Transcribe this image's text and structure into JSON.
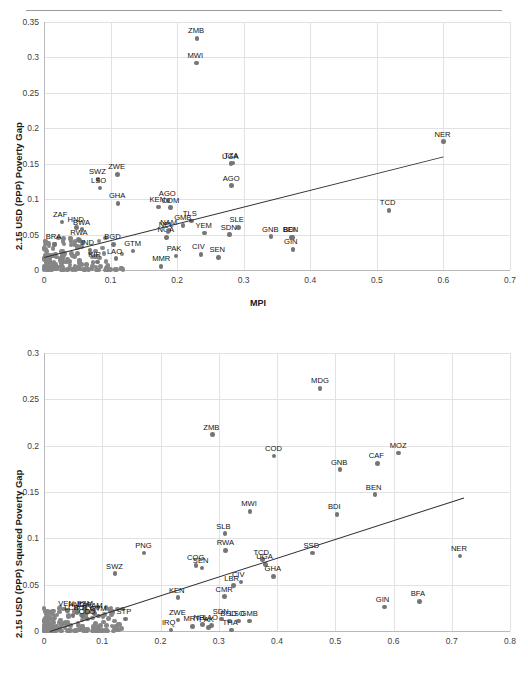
{
  "document": {
    "clipped_header_text": "2.15 USD (PPP) poverty measures and MPI"
  },
  "charts": [
    {
      "id": "chart1",
      "ylabel": "2.15 USD (PPP)  Poverty Gap",
      "xlabel": "MPI",
      "yticks": [
        "0",
        "0.05",
        "0.1",
        "0.15",
        "0.2",
        "0.25",
        "0.3",
        "0.35"
      ],
      "xticks": [
        "0",
        "0.1",
        "0.2",
        "0.3",
        "0.4",
        "0.5",
        "0.6",
        "0.7"
      ]
    },
    {
      "id": "chart2",
      "ylabel": "2.15 USD (PPP) Squared  Poverty Gap",
      "xlabel": "",
      "yticks": [
        "0",
        "0.05",
        "0.1",
        "0.15",
        "0.2",
        "0.25",
        "0.3"
      ],
      "xticks": [
        "0",
        "0.1",
        "0.2",
        "0.3",
        "0.4",
        "0.5",
        "0.6",
        "0.7",
        "0.8"
      ]
    }
  ],
  "chart_data": [
    {
      "type": "scatter",
      "title": "",
      "xlabel": "MPI",
      "ylabel": "2.15 USD (PPP)  Poverty Gap",
      "xlim": [
        0,
        0.7
      ],
      "ylim": [
        0,
        0.35
      ],
      "grid": true,
      "legend": "none",
      "trendline": {
        "x0": 0.0,
        "y0": 0.018,
        "x1": 0.6,
        "y1": 0.16
      },
      "labeled_points": [
        {
          "label": "ZMB",
          "x": 0.23,
          "y": 0.327
        },
        {
          "label": "MWI",
          "x": 0.229,
          "y": 0.292
        },
        {
          "label": "NER",
          "x": 0.6,
          "y": 0.181
        },
        {
          "label": "UGA",
          "x": 0.281,
          "y": 0.15
        },
        {
          "label": "TZA",
          "x": 0.284,
          "y": 0.151
        },
        {
          "label": "AGO",
          "x": 0.282,
          "y": 0.119
        },
        {
          "label": "ZWE",
          "x": 0.11,
          "y": 0.135
        },
        {
          "label": "SWZ",
          "x": 0.081,
          "y": 0.128
        },
        {
          "label": "LSO",
          "x": 0.084,
          "y": 0.116
        },
        {
          "label": "TCD",
          "x": 0.518,
          "y": 0.084
        },
        {
          "label": "GHA",
          "x": 0.111,
          "y": 0.094
        },
        {
          "label": "AGO2",
          "x": 0.186,
          "y": 0.098
        },
        {
          "label": "KEN",
          "x": 0.172,
          "y": 0.089
        },
        {
          "label": "COM",
          "x": 0.19,
          "y": 0.088
        },
        {
          "label": "ZAF",
          "x": 0.027,
          "y": 0.068
        },
        {
          "label": "NAM",
          "x": 0.188,
          "y": 0.056
        },
        {
          "label": "TLS",
          "x": 0.222,
          "y": 0.069
        },
        {
          "label": "GMB",
          "x": 0.209,
          "y": 0.063
        },
        {
          "label": "YEM",
          "x": 0.241,
          "y": 0.052
        },
        {
          "label": "SLE",
          "x": 0.292,
          "y": 0.06
        },
        {
          "label": "SDN",
          "x": 0.279,
          "y": 0.05
        },
        {
          "label": "GNB",
          "x": 0.341,
          "y": 0.047
        },
        {
          "label": "BEN",
          "x": 0.372,
          "y": 0.046
        },
        {
          "label": "GIN",
          "x": 0.374,
          "y": 0.029
        },
        {
          "label": "BDI",
          "x": 0.373,
          "y": 0.046
        },
        {
          "label": "HND",
          "x": 0.049,
          "y": 0.06
        },
        {
          "label": "RWA",
          "x": 0.053,
          "y": 0.042
        },
        {
          "label": "BRA",
          "x": 0.016,
          "y": 0.036
        },
        {
          "label": "IND",
          "x": 0.069,
          "y": 0.028
        },
        {
          "label": "BGD",
          "x": 0.104,
          "y": 0.036
        },
        {
          "label": "GTM",
          "x": 0.134,
          "y": 0.027
        },
        {
          "label": "LAO",
          "x": 0.108,
          "y": 0.016
        },
        {
          "label": "KIR",
          "x": 0.08,
          "y": 0.011
        },
        {
          "label": "PAK",
          "x": 0.198,
          "y": 0.02
        },
        {
          "label": "MMR",
          "x": 0.176,
          "y": 0.005
        },
        {
          "label": "CIV",
          "x": 0.236,
          "y": 0.022
        },
        {
          "label": "SEN",
          "x": 0.262,
          "y": 0.018
        },
        {
          "label": "NGA",
          "x": 0.184,
          "y": 0.046
        },
        {
          "label": "BWA",
          "x": 0.057,
          "y": 0.057
        },
        {
          "label": "NPL",
          "x": 0.186,
          "y": 0.054
        }
      ]
    },
    {
      "type": "scatter",
      "title": "",
      "xlabel": "",
      "ylabel": "2.15 USD (PPP) Squared  Poverty Gap",
      "xlim": [
        0,
        0.8
      ],
      "ylim": [
        0,
        0.3
      ],
      "grid": true,
      "legend": "none",
      "trendline": {
        "x0": 0.01,
        "y0": 0.0,
        "x1": 0.72,
        "y1": 0.144
      },
      "labeled_points": [
        {
          "label": "MDG",
          "x": 0.474,
          "y": 0.262
        },
        {
          "label": "ZMB",
          "x": 0.289,
          "y": 0.212
        },
        {
          "label": "COD",
          "x": 0.395,
          "y": 0.189
        },
        {
          "label": "MOZ",
          "x": 0.609,
          "y": 0.192
        },
        {
          "label": "CAF",
          "x": 0.573,
          "y": 0.181
        },
        {
          "label": "GNB",
          "x": 0.508,
          "y": 0.174
        },
        {
          "label": "BEN",
          "x": 0.568,
          "y": 0.147
        },
        {
          "label": "MWI",
          "x": 0.354,
          "y": 0.129
        },
        {
          "label": "BDI",
          "x": 0.503,
          "y": 0.126
        },
        {
          "label": "SLB",
          "x": 0.311,
          "y": 0.105
        },
        {
          "label": "RWA",
          "x": 0.312,
          "y": 0.087
        },
        {
          "label": "SSD",
          "x": 0.461,
          "y": 0.084
        },
        {
          "label": "PNG",
          "x": 0.172,
          "y": 0.084
        },
        {
          "label": "NER",
          "x": 0.714,
          "y": 0.081
        },
        {
          "label": "TCD",
          "x": 0.375,
          "y": 0.077
        },
        {
          "label": "UGA",
          "x": 0.38,
          "y": 0.072
        },
        {
          "label": "COG",
          "x": 0.261,
          "y": 0.071
        },
        {
          "label": "SEN",
          "x": 0.271,
          "y": 0.068
        },
        {
          "label": "SWZ",
          "x": 0.122,
          "y": 0.062
        },
        {
          "label": "GHA",
          "x": 0.394,
          "y": 0.059
        },
        {
          "label": "CIV",
          "x": 0.338,
          "y": 0.053
        },
        {
          "label": "BFA",
          "x": 0.645,
          "y": 0.032
        },
        {
          "label": "GIN",
          "x": 0.585,
          "y": 0.026
        },
        {
          "label": "KEN",
          "x": 0.23,
          "y": 0.036
        },
        {
          "label": "CMR",
          "x": 0.31,
          "y": 0.037
        },
        {
          "label": "LBR",
          "x": 0.325,
          "y": 0.049
        },
        {
          "label": "VEN",
          "x": 0.04,
          "y": 0.022
        },
        {
          "label": "FSM",
          "x": 0.072,
          "y": 0.022
        },
        {
          "label": "HND",
          "x": 0.057,
          "y": 0.02
        },
        {
          "label": "ZAF",
          "x": 0.073,
          "y": 0.02
        },
        {
          "label": "NAM",
          "x": 0.087,
          "y": 0.019
        },
        {
          "label": "LCA",
          "x": 0.05,
          "y": 0.017
        },
        {
          "label": "BOL",
          "x": 0.066,
          "y": 0.017
        },
        {
          "label": "GTM",
          "x": 0.094,
          "y": 0.016
        },
        {
          "label": "COD2",
          "x": 0.075,
          "y": 0.013
        },
        {
          "label": "STP",
          "x": 0.14,
          "y": 0.013
        },
        {
          "label": "ZWE",
          "x": 0.23,
          "y": 0.012
        },
        {
          "label": "SDN",
          "x": 0.305,
          "y": 0.013
        },
        {
          "label": "BGD",
          "x": 0.318,
          "y": 0.011
        },
        {
          "label": "LSO",
          "x": 0.334,
          "y": 0.011
        },
        {
          "label": "GMB",
          "x": 0.353,
          "y": 0.011
        },
        {
          "label": "IRQ",
          "x": 0.218,
          "y": 0.001
        },
        {
          "label": "MRT",
          "x": 0.255,
          "y": 0.005
        },
        {
          "label": "NPL",
          "x": 0.272,
          "y": 0.007
        },
        {
          "label": "LAO",
          "x": 0.288,
          "y": 0.006
        },
        {
          "label": "PAK",
          "x": 0.282,
          "y": 0.004
        },
        {
          "label": "THA",
          "x": 0.322,
          "y": 0.001
        }
      ]
    }
  ]
}
